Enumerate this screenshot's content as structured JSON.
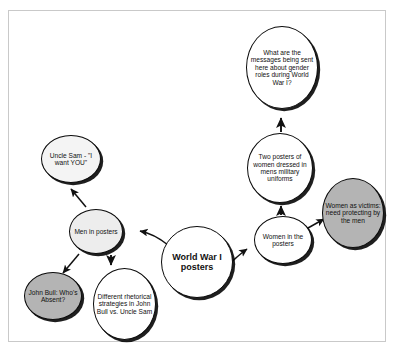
{
  "diagram": {
    "colors": {
      "node_border": "#0a0a0a",
      "edge": "#111111",
      "fill_white": "#ffffff",
      "fill_light": "#ededed",
      "fill_gray": "#b4b4b4",
      "frame_border": "#c9c9c9",
      "background": "#ffffff"
    },
    "nodes": [
      {
        "id": "center",
        "label": "World War I posters",
        "fill": "#ffffff",
        "emphasis": "bold"
      },
      {
        "id": "men-in-posters",
        "label": "Men in posters",
        "fill": "#ededed"
      },
      {
        "id": "uncle-sam",
        "label": "Uncle Sam - \"I want YOU\"",
        "fill": "#f4f4f4"
      },
      {
        "id": "john-bull",
        "label": "John Bull: Who's Absent?",
        "fill": "#b4b4b4"
      },
      {
        "id": "different-rhetorical",
        "label": "Different rhetorical strategies in John Bull vs. Uncle Sam",
        "fill": "#ffffff"
      },
      {
        "id": "women-in-the-posters",
        "label": "Women in the posters",
        "fill": "#ffffff"
      },
      {
        "id": "women-as-victims",
        "label": "Women as victims: need protecting by the men",
        "fill": "#b4b4b4"
      },
      {
        "id": "two-posters",
        "label": "Two posters of women dressed in mens military uniforms",
        "fill": "#ffffff"
      },
      {
        "id": "gender-roles-question",
        "label": "What are the messages being sent here about gender roles during World War I?",
        "fill": "#ffffff"
      }
    ],
    "edges": [
      {
        "from": "center",
        "to": "men-in-posters",
        "arrow": "to"
      },
      {
        "from": "men-in-posters",
        "to": "uncle-sam",
        "arrow": "to"
      },
      {
        "from": "men-in-posters",
        "to": "john-bull",
        "arrow": "to"
      },
      {
        "from": "men-in-posters",
        "to": "different-rhetorical",
        "arrow": "to"
      },
      {
        "from": "center",
        "to": "women-in-the-posters",
        "arrow": "to"
      },
      {
        "from": "women-in-the-posters",
        "to": "women-as-victims",
        "arrow": "to"
      },
      {
        "from": "women-in-the-posters",
        "to": "two-posters",
        "arrow": "to"
      },
      {
        "from": "two-posters",
        "to": "gender-roles-question",
        "arrow": "to"
      }
    ]
  }
}
